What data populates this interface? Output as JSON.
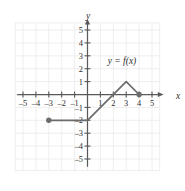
{
  "figure": {
    "axis_label_x": "x",
    "axis_label_y": "y",
    "curve_label": "y = f(x)",
    "line_color": "#6b6b6b",
    "grid_color": "#ececec",
    "axis_color": "#59595b",
    "text_color": "#2f2f2f"
  },
  "chart_data": {
    "type": "line",
    "title": "",
    "xlabel": "x",
    "ylabel": "y",
    "xlim": [
      -5.5,
      5.5
    ],
    "ylim": [
      -5.5,
      5.5
    ],
    "grid": true,
    "legend": "none",
    "annotations": [
      {
        "text": "y = f(x)",
        "x": 2.45,
        "y": 2.0
      }
    ],
    "xticks": [
      -5,
      -4,
      -3,
      -2,
      -1,
      1,
      2,
      3,
      4,
      5
    ],
    "xticklabels": [
      "–5",
      "–4",
      "–3",
      "–2",
      "–1",
      "1",
      "2",
      "3",
      "4",
      "5"
    ],
    "yticks": [
      5,
      4,
      3,
      2,
      1,
      -1,
      -2,
      -3,
      -4,
      -5
    ],
    "yticklabels": [
      "5",
      "4",
      "3",
      "2",
      "1",
      "–1",
      "–2",
      "–3",
      "–4",
      "–5"
    ],
    "series": [
      {
        "name": "f",
        "points": [
          {
            "x": -3,
            "y": -2
          },
          {
            "x": 0,
            "y": -2
          },
          {
            "x": 3,
            "y": 1
          },
          {
            "x": 4,
            "y": 0
          }
        ]
      }
    ],
    "endpoints": [
      {
        "x": -3,
        "y": -2,
        "style": "filled"
      },
      {
        "x": 4,
        "y": 0,
        "style": "filled"
      }
    ]
  }
}
